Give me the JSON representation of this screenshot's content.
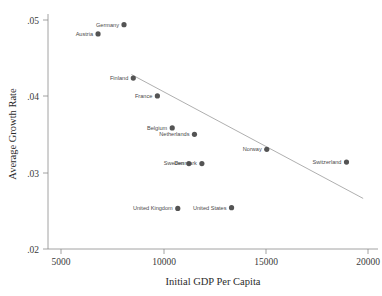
{
  "chart_data": {
    "type": "scatter",
    "title": "",
    "xlabel": "Initial GDP Per Capita",
    "ylabel": "Average Growth Rate",
    "xlim": [
      3700,
      21500
    ],
    "ylim": [
      0.0185,
      0.0515
    ],
    "xticks": [
      5000,
      10000,
      15000,
      20000
    ],
    "xticklabels": [
      "5000",
      "10000",
      "15000",
      "20000"
    ],
    "yticks": [
      0.02,
      0.03,
      0.04,
      0.05
    ],
    "yticklabels": [
      ".02",
      ".03",
      ".04",
      ".05"
    ],
    "grid": false,
    "legend": null,
    "marker_color": "#545454",
    "fit_line_color": "#9a9a9a",
    "axis_color": "#8a8a8a",
    "points": [
      {
        "label": "Germany",
        "x": 7800,
        "y": 0.05,
        "label_pos": "left"
      },
      {
        "label": "Austria",
        "x": 6400,
        "y": 0.0487,
        "label_pos": "left"
      },
      {
        "label": "Finland",
        "x": 8300,
        "y": 0.0425,
        "label_pos": "left"
      },
      {
        "label": "France",
        "x": 9600,
        "y": 0.04,
        "label_pos": "left"
      },
      {
        "label": "Belgium",
        "x": 10400,
        "y": 0.0355,
        "label_pos": "left"
      },
      {
        "label": "Netherlands",
        "x": 11600,
        "y": 0.0346,
        "label_pos": "left"
      },
      {
        "label": "Sweden",
        "x": 11300,
        "y": 0.0305,
        "label_pos": "left"
      },
      {
        "label": "Denmark",
        "x": 12000,
        "y": 0.0305,
        "label_pos": "left"
      },
      {
        "label": "Norway",
        "x": 15500,
        "y": 0.0325,
        "label_pos": "left"
      },
      {
        "label": "Switzerland",
        "x": 19800,
        "y": 0.0307,
        "label_pos": "left"
      },
      {
        "label": "United Kingdom",
        "x": 10700,
        "y": 0.0242,
        "label_pos": "left"
      },
      {
        "label": "United States",
        "x": 13600,
        "y": 0.0243,
        "label_pos": "left"
      }
    ],
    "fit_line": {
      "x0": 8200,
      "y0": 0.043,
      "x1": 20700,
      "y1": 0.0256
    }
  }
}
